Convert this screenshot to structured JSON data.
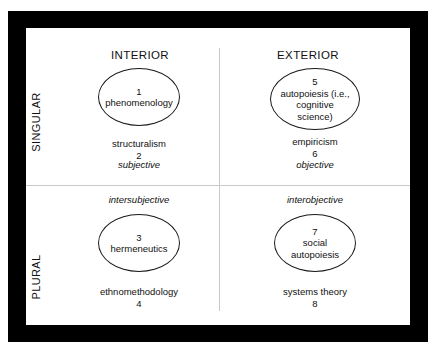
{
  "diagram": {
    "frame_color": "#000000",
    "canvas_color": "#ffffff",
    "divider_color": "#c9c9c9",
    "text_color": "#111111",
    "ellipse_stroke_color": "#1a1a1a"
  },
  "columns": {
    "interior": "INTERIOR",
    "exterior": "EXTERIOR"
  },
  "rows": {
    "singular": "SINGULAR",
    "plural": "PLURAL"
  },
  "axis_labels": {
    "subjective": "subjective",
    "objective": "objective",
    "intersubjective": "intersubjective",
    "interobjective": "interobjective"
  },
  "quadrants": {
    "upper_left": {
      "position": "interior-singular",
      "ellipse_number": "1",
      "ellipse_label": "phenomenology",
      "below_label": "structuralism",
      "below_number": "2"
    },
    "upper_right": {
      "position": "exterior-singular",
      "ellipse_number": "5",
      "ellipse_label_line1": "autopoiesis (i.e.,",
      "ellipse_label_line2": "cognitive",
      "ellipse_label_line3": "science)",
      "below_label": "empiricism",
      "below_number": "6"
    },
    "lower_left": {
      "position": "interior-plural",
      "ellipse_number": "3",
      "ellipse_label": "hermeneutics",
      "below_label": "ethnomethodology",
      "below_number": "4"
    },
    "lower_right": {
      "position": "exterior-plural",
      "ellipse_number": "7",
      "ellipse_label_line1": "social",
      "ellipse_label_line2": "autopoiesis",
      "below_label": "systems theory",
      "below_number": "8"
    }
  }
}
